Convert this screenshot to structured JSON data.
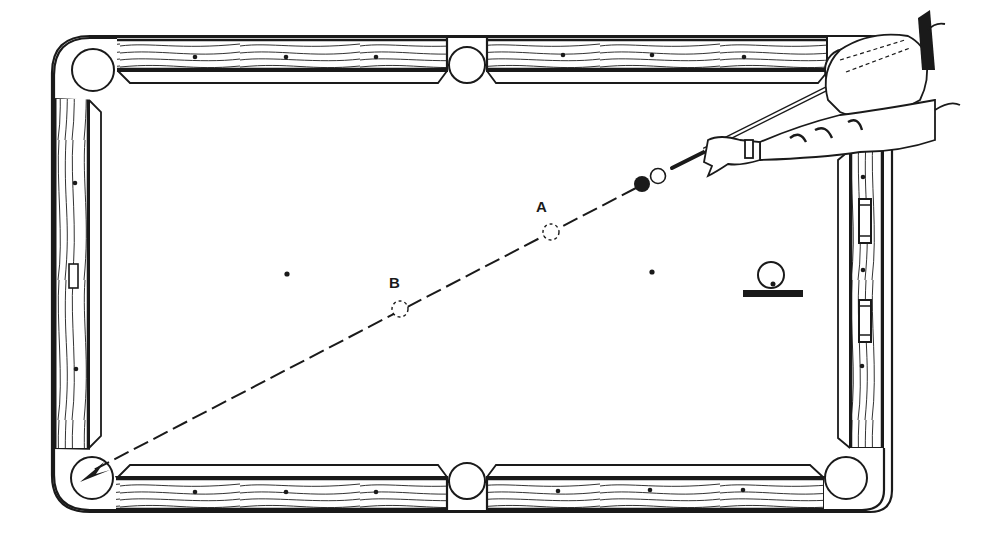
{
  "diagram": {
    "colors": {
      "ink": "#1a1a1a",
      "paper": "#ffffff"
    },
    "labels": {
      "a": "A",
      "b": "B"
    },
    "points": {
      "cue_ball": {
        "x": 658,
        "y": 176,
        "style": "open"
      },
      "object_ball": {
        "x": 642,
        "y": 184,
        "style": "solid"
      },
      "ghost_a": {
        "x": 551,
        "y": 232,
        "style": "dashed",
        "label": "A"
      },
      "ghost_b": {
        "x": 400,
        "y": 309,
        "style": "dashed",
        "label": "B"
      },
      "target_pocket": "bottom-left corner pocket"
    },
    "inset_icon": {
      "name": "ball-contact-point-icon",
      "description": "cue ball above a bar with dot marking low hit"
    },
    "table": {
      "pockets": [
        "top-left",
        "top-middle",
        "top-right",
        "bottom-left",
        "bottom-middle",
        "bottom-right"
      ],
      "diamonds_per_long_rail_segment": 3,
      "diamonds_per_short_rail": 3
    }
  }
}
